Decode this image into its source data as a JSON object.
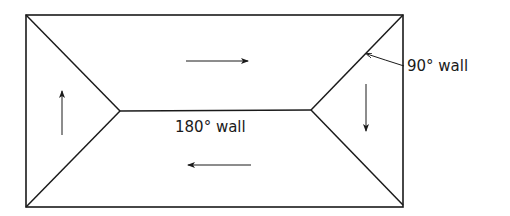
{
  "diagram": {
    "labels": {
      "center_wall": "180° wall",
      "diagonal_wall": "90° wall"
    },
    "domains": [
      {
        "name": "top",
        "magnetization": "right"
      },
      {
        "name": "bottom",
        "magnetization": "left"
      },
      {
        "name": "left",
        "magnetization": "up"
      },
      {
        "name": "right",
        "magnetization": "down"
      }
    ],
    "colors": {
      "line": "#1a1a1a",
      "background": "#ffffff"
    }
  }
}
